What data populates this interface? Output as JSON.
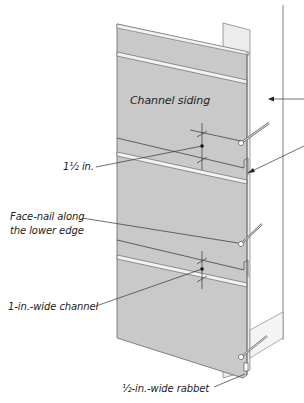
{
  "diagram": {
    "type": "technical-illustration",
    "colors": {
      "board_fill": "#c8c8c8",
      "board_edge": "#555555",
      "background": "#ffffff",
      "text": "#222222",
      "sheathing_fill": "#ebebeb"
    }
  },
  "labels": {
    "title_on_board": "Channel siding",
    "dimension_reveal": "1½ in.",
    "face_nail": [
      "Face-nail along",
      "the lower edge"
    ],
    "channel_width": "1-in.-wide channel",
    "rabbet_width": "½-in.-wide rabbet"
  }
}
